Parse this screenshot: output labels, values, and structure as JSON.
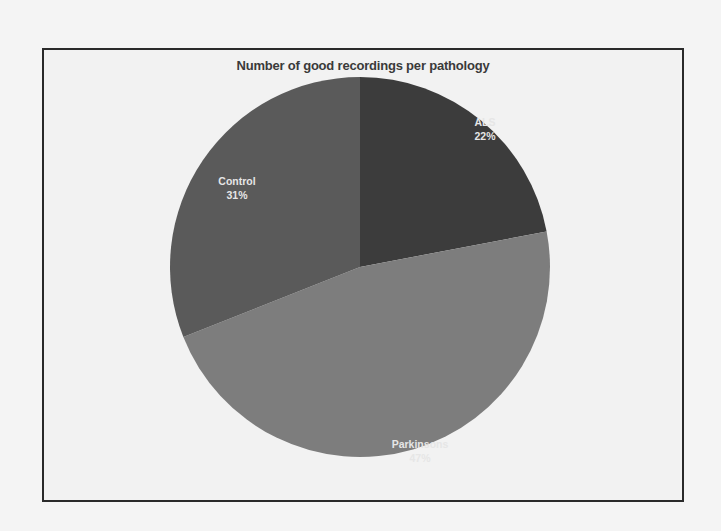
{
  "chart_data": {
    "type": "pie",
    "title": "Number of good recordings per pathology",
    "categories": [
      "ALS",
      "Parkinsons",
      "Control"
    ],
    "values": [
      22,
      47,
      31
    ],
    "unit": "%",
    "labels": [
      "ALS\n22%",
      "Parkinsons\n47%",
      "Control\n31%"
    ],
    "colors": [
      "#3c3c3c",
      "#7d7d7d",
      "#5a5a5a"
    ],
    "start_angle_deg": 0,
    "direction": "clockwise",
    "legend": "none",
    "data_labels": "inside"
  },
  "slices": [
    {
      "name": "ALS",
      "pct": "22%",
      "color": "#3c3c3c"
    },
    {
      "name": "Parkinsons",
      "pct": "47%",
      "color": "#7d7d7d"
    },
    {
      "name": "Control",
      "pct": "31%",
      "color": "#5a5a5a"
    }
  ]
}
